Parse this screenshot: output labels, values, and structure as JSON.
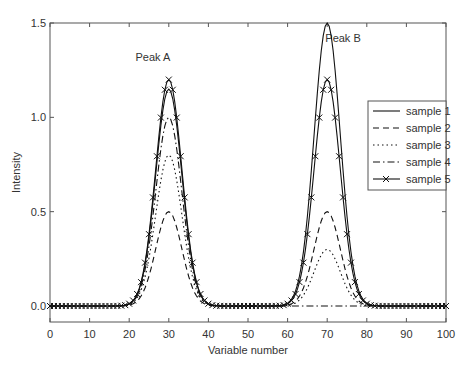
{
  "chart_data": {
    "type": "line",
    "title": "",
    "xlabel": "Variable number",
    "ylabel": "Intensity",
    "xlim": [
      0,
      100
    ],
    "ylim": [
      -0.1,
      1.5
    ],
    "xticks": [
      0,
      10,
      20,
      30,
      40,
      50,
      60,
      70,
      80,
      90,
      100
    ],
    "yticks": [
      "0.0",
      "0.5",
      "1.0",
      "1.5"
    ],
    "grid": false,
    "legend_position": "right, upper-middle inside axes",
    "annotations": [
      {
        "text": "Peak A",
        "x": 26,
        "y": 1.3
      },
      {
        "text": "Peak B",
        "x": 74,
        "y": 1.4
      }
    ],
    "peak_model": "gaussian, centers 30 and 70, sigma ~3.3",
    "series": [
      {
        "name": "sample 1",
        "style": "solid",
        "peakA": 1.15,
        "peakB": 1.5
      },
      {
        "name": "sample 2",
        "style": "dashed",
        "peakA": 0.5,
        "peakB": 0.5
      },
      {
        "name": "sample 3",
        "style": "dotted",
        "peakA": 0.8,
        "peakB": 0.3
      },
      {
        "name": "sample 4",
        "style": "dashdot",
        "peakA": 1.0,
        "peakB": 0.0
      },
      {
        "name": "sample 5",
        "style": "solid-x-markers",
        "peakA": 1.2,
        "peakB": 1.2
      }
    ]
  }
}
